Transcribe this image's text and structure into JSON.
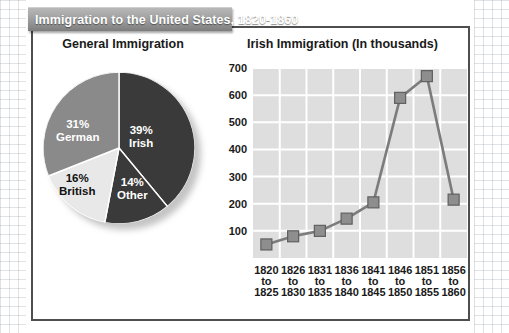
{
  "header": {
    "title": "Immigration to the United States, 1820-1860"
  },
  "panels": {
    "left_heading": "General Immigration",
    "right_heading": "Irish Immigration (In thousands)"
  },
  "chart_data": [
    {
      "type": "pie",
      "title": "General Immigration",
      "legend_position": "inside-slices",
      "slices": [
        {
          "label": "Irish",
          "value": 39,
          "display": "39%",
          "color": "#3a3a3a",
          "text_color": "#ffffff"
        },
        {
          "label": "Other",
          "value": 14,
          "display": "14%",
          "color": "#3a3a3a",
          "text_color": "#ffffff"
        },
        {
          "label": "British",
          "value": 16,
          "display": "16%",
          "color": "#e8e8e8",
          "text_color": "#111111"
        },
        {
          "label": "German",
          "value": 31,
          "display": "31%",
          "color": "#8a8a8a",
          "text_color": "#ffffff"
        }
      ]
    },
    {
      "type": "line",
      "title": "Irish Immigration (In thousands)",
      "xlabel": "",
      "ylabel": "",
      "ylim": [
        0,
        700
      ],
      "yticks": [
        100,
        200,
        300,
        400,
        500,
        600,
        700
      ],
      "grid": true,
      "categories": [
        "1820\nto\n1825",
        "1826\nto\n1830",
        "1831\nto\n1835",
        "1836\nto\n1840",
        "1841\nto\n1845",
        "1846\nto\n1850",
        "1851\nto\n1855",
        "1856\nto\n1860"
      ],
      "category_lines": [
        [
          "1820",
          "to",
          "1825"
        ],
        [
          "1826",
          "to",
          "1830"
        ],
        [
          "1831",
          "to",
          "1835"
        ],
        [
          "1836",
          "to",
          "1840"
        ],
        [
          "1841",
          "to",
          "1845"
        ],
        [
          "1846",
          "to",
          "1850"
        ],
        [
          "1851",
          "to",
          "1855"
        ],
        [
          "1856",
          "to",
          "1860"
        ]
      ],
      "values": [
        50,
        80,
        100,
        145,
        205,
        590,
        670,
        215
      ],
      "marker": "square",
      "line_color": "#7c7c7c",
      "marker_color": "#8e8e8e",
      "plot_background": "#dedede",
      "gridline_color": "#ffffff"
    }
  ]
}
